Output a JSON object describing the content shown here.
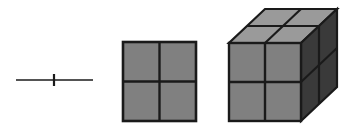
{
  "figure": {
    "canvas": {
      "width": 352,
      "height": 128,
      "background": "#ffffff"
    },
    "palette": {
      "outline": "#1a1a1a",
      "front_face": "#808080",
      "top_face": "#9a9a9a",
      "side_face": "#3a3a3a",
      "segment_line": "#1a1a1a",
      "background": "#ffffff"
    },
    "objects": [
      {
        "name": "segment",
        "dimension": 1,
        "divisions": 2,
        "parts": 2,
        "geometry": {
          "x1": 16,
          "y1": 80,
          "x2": 93,
          "y2": 80,
          "tick_x": 54,
          "tick_y1": 74,
          "tick_y2": 86,
          "line_width": 1.6,
          "tick_width": 2.2
        }
      },
      {
        "name": "square",
        "dimension": 2,
        "divisions": 2,
        "parts": 4,
        "geometry": {
          "x": 123,
          "y": 42,
          "width": 73,
          "height": 79,
          "mid_x": 159.5,
          "mid_y": 81.5,
          "stroke_width": 2.4,
          "fill": "#808080"
        }
      },
      {
        "name": "cube",
        "dimension": 3,
        "divisions": 2,
        "parts": 8,
        "geometry": {
          "front": {
            "x": 229,
            "y": 43,
            "width": 72,
            "height": 78
          },
          "depth_dx": 36,
          "depth_dy": -34,
          "stroke_width": 2.2,
          "fill_front": "#808080",
          "fill_top": "#9a9a9a",
          "fill_side": "#3a3a3a"
        }
      }
    ]
  }
}
